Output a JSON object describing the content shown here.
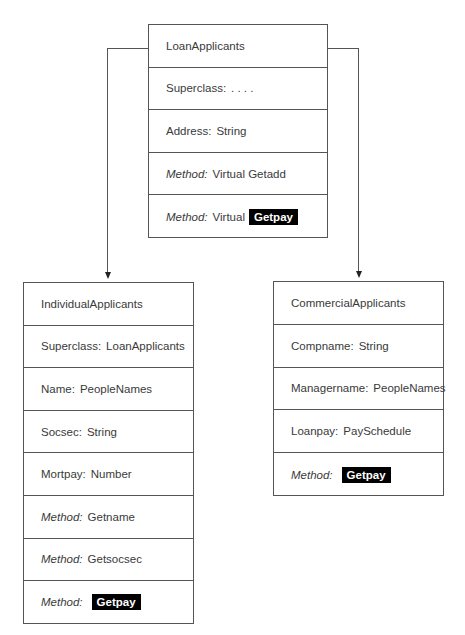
{
  "diagram": {
    "type": "class-hierarchy",
    "parent": {
      "name": "LoanApplicants",
      "rows": [
        {
          "kind": "title",
          "text": "LoanApplicants"
        },
        {
          "kind": "attr",
          "label": "Superclass:",
          "value": ". . . ."
        },
        {
          "kind": "attr",
          "label": "Address:",
          "value": "String"
        },
        {
          "kind": "method",
          "keyword": "Method:",
          "value": "Virtual Getadd",
          "highlight": ""
        },
        {
          "kind": "method",
          "keyword": "Method:",
          "value": "Virtual",
          "highlight": "Getpay"
        }
      ]
    },
    "children": [
      {
        "name": "IndividualApplicants",
        "rows": [
          {
            "kind": "title",
            "text": "IndividualApplicants"
          },
          {
            "kind": "attr",
            "label": "Superclass:",
            "value": "LoanApplicants"
          },
          {
            "kind": "attr",
            "label": "Name:",
            "value": "PeopleNames"
          },
          {
            "kind": "attr",
            "label": "Socsec:",
            "value": "String"
          },
          {
            "kind": "attr",
            "label": "Mortpay:",
            "value": "Number"
          },
          {
            "kind": "method",
            "keyword": "Method:",
            "value": "Getname",
            "highlight": ""
          },
          {
            "kind": "method",
            "keyword": "Method:",
            "value": "Getsocsec",
            "highlight": ""
          },
          {
            "kind": "method",
            "keyword": "Method:",
            "value": "",
            "highlight": "Getpay"
          }
        ]
      },
      {
        "name": "CommercialApplicants",
        "rows": [
          {
            "kind": "title",
            "text": "CommercialApplicants"
          },
          {
            "kind": "attr",
            "label": "Compname:",
            "value": "String"
          },
          {
            "kind": "attr",
            "label": "Managername:",
            "value": "PeopleNames"
          },
          {
            "kind": "attr",
            "label": "Loanpay:",
            "value": "PaySchedule"
          },
          {
            "kind": "method",
            "keyword": "Method:",
            "value": "",
            "highlight": "Getpay"
          }
        ]
      }
    ],
    "edges": [
      {
        "from": "LoanApplicants",
        "to": "IndividualApplicants"
      },
      {
        "from": "LoanApplicants",
        "to": "CommercialApplicants"
      }
    ]
  }
}
